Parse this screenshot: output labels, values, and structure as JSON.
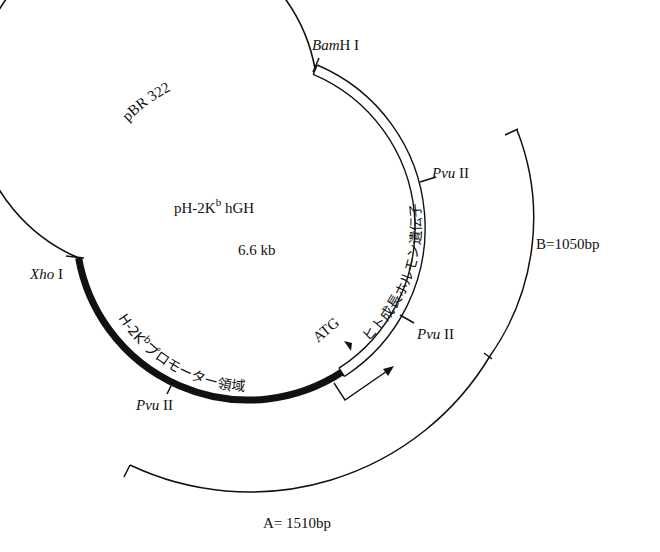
{
  "plasmid": {
    "name": "pH-2K",
    "name_sup": "b",
    "name_suffix": " hGH",
    "size": "6.6 kb",
    "backbone_label": "pBR 322"
  },
  "sites": {
    "bamhi": {
      "italic": "Bam",
      "roman": "H I"
    },
    "pvu_upper": {
      "italic": "Pvu",
      "roman": " II"
    },
    "pvu_lower": {
      "italic": "Pvu",
      "roman": " II"
    },
    "pvu_bottom": {
      "italic": "Pvu",
      "roman": " II"
    },
    "xhoi": {
      "italic": "Xho",
      "roman": " I"
    }
  },
  "regions": {
    "promoter": "H-2K",
    "promoter_sup": "b",
    "promoter_rest": "プロモーター領域",
    "gene": "ヒト成長ホルモン遺伝子",
    "atg": "ATG"
  },
  "fragments": {
    "a": "A= 1510bp",
    "b": "B=1050bp"
  },
  "colors": {
    "line": "#111111",
    "background": "#ffffff"
  }
}
